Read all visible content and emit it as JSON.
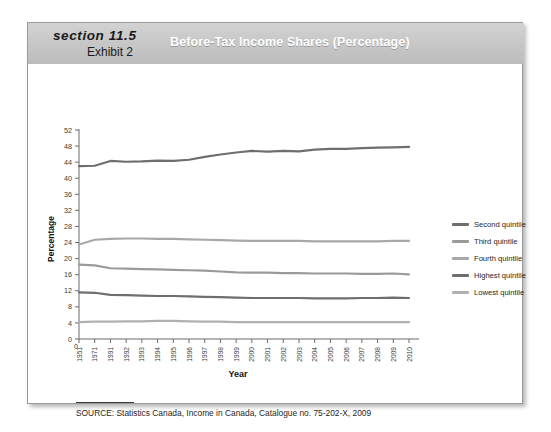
{
  "header": {
    "section_label": "section 11.5",
    "exhibit_label": "Exhibit 2",
    "title": "Before-Tax Income Shares (Percentage)"
  },
  "source": {
    "text": "SOURCE: Statistics Canada, Income in Canada, Catalogue no. 75-202-X, 2009"
  },
  "colors": {
    "header_band": "#c6c6c6",
    "title_text": "#ffffff",
    "dark_line": "#6e6e6e",
    "mid_line": "#8c8c8c",
    "light_line": "#a8a8a8",
    "axis": "#6b6b6b"
  },
  "chart_data": {
    "type": "line",
    "title": "Before-Tax Income Shares (Percentage)",
    "xlabel": "Year",
    "ylabel": "Percentage",
    "ylim": [
      0,
      52
    ],
    "ytick_step": 4,
    "yticks": [
      0,
      4,
      8,
      12,
      16,
      20,
      24,
      28,
      32,
      36,
      40,
      44,
      48,
      52
    ],
    "grid": false,
    "legend_position": "right",
    "categories": [
      "1951",
      "1971",
      "1991",
      "1992",
      "1993",
      "1994",
      "1995",
      "1996",
      "1997",
      "1998",
      "1999",
      "2000",
      "2001",
      "2002",
      "2003",
      "2004",
      "2005",
      "2006",
      "2007",
      "2008",
      "2009",
      "2010"
    ],
    "series": [
      {
        "name": "Highest quintile",
        "color": "#6e6e6e",
        "values": [
          43.0,
          43.1,
          44.3,
          44.1,
          44.2,
          44.4,
          44.3,
          44.6,
          45.3,
          45.9,
          46.4,
          46.8,
          46.6,
          46.8,
          46.7,
          47.1,
          47.3,
          47.3,
          47.5,
          47.6,
          47.7,
          47.8
        ]
      },
      {
        "name": "Fourth quintile",
        "color": "#a8a8a8",
        "values": [
          23.5,
          24.7,
          24.9,
          25.0,
          25.0,
          24.9,
          24.9,
          24.8,
          24.7,
          24.6,
          24.5,
          24.4,
          24.4,
          24.4,
          24.4,
          24.3,
          24.3,
          24.3,
          24.3,
          24.3,
          24.4,
          24.4
        ]
      },
      {
        "name": "Third quintile",
        "color": "#9a9a9a",
        "values": [
          18.5,
          18.3,
          17.6,
          17.5,
          17.4,
          17.3,
          17.2,
          17.1,
          17.0,
          16.8,
          16.6,
          16.5,
          16.5,
          16.4,
          16.4,
          16.3,
          16.3,
          16.3,
          16.2,
          16.2,
          16.3,
          16.1
        ]
      },
      {
        "name": "Second quintile",
        "color": "#6e6e6e",
        "values": [
          11.6,
          11.5,
          11.0,
          10.9,
          10.8,
          10.7,
          10.7,
          10.6,
          10.5,
          10.4,
          10.3,
          10.2,
          10.2,
          10.2,
          10.2,
          10.1,
          10.1,
          10.1,
          10.2,
          10.2,
          10.3,
          10.2
        ]
      },
      {
        "name": "Lowest quintile",
        "color": "#b0b0b0",
        "values": [
          4.2,
          4.3,
          4.3,
          4.4,
          4.4,
          4.5,
          4.5,
          4.4,
          4.3,
          4.3,
          4.2,
          4.2,
          4.2,
          4.2,
          4.2,
          4.2,
          4.2,
          4.2,
          4.2,
          4.2,
          4.2,
          4.2
        ]
      }
    ],
    "legend_order": [
      "Second quintile",
      "Third quintile",
      "Fourth quintile",
      "Highest quintile",
      "Lowest quintile"
    ]
  }
}
